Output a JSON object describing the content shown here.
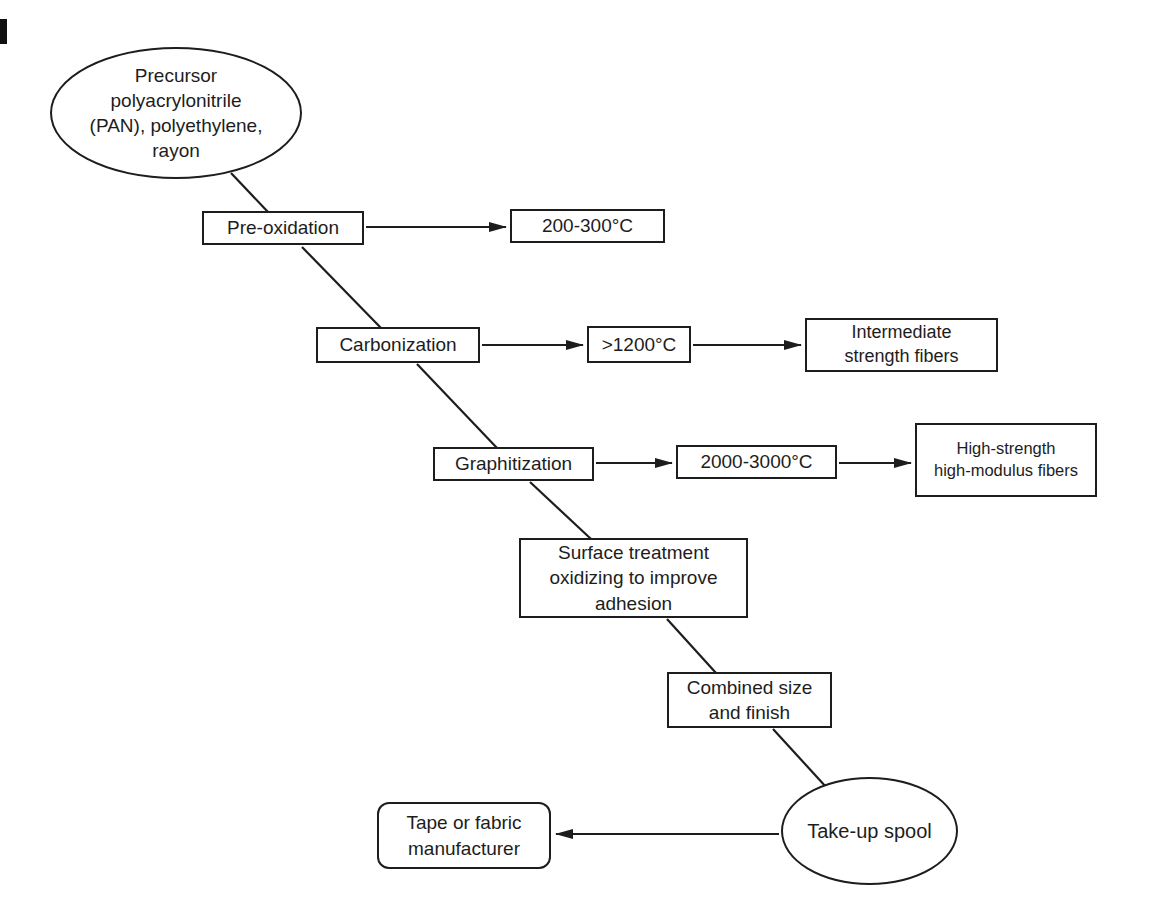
{
  "colors": {
    "ink": "#1d1d1d",
    "paper": "#ffffff"
  },
  "nodes": {
    "precursor": {
      "shape": "ellipse",
      "label": "Precursor\npolyacrylonitrile\n(PAN), polyethylene,\nrayon"
    },
    "pre_oxidation": {
      "shape": "rect",
      "label": "Pre-oxidation"
    },
    "temp_pre_oxidation": {
      "shape": "rect",
      "label": "200-300°C"
    },
    "carbonization": {
      "shape": "rect",
      "label": "Carbonization"
    },
    "temp_carbonization": {
      "shape": "rect",
      "label": ">1200°C"
    },
    "intermediate_fibers": {
      "shape": "rect",
      "label": "Intermediate\nstrength fibers"
    },
    "graphitization": {
      "shape": "rect",
      "label": "Graphitization"
    },
    "temp_graphitization": {
      "shape": "rect",
      "label": "2000-3000°C"
    },
    "high_modulus_fibers": {
      "shape": "rect",
      "label": "High-strength\nhigh-modulus fibers"
    },
    "surface_treatment": {
      "shape": "rect",
      "label": "Surface treatment\noxidizing to improve\nadhesion"
    },
    "combined_size_finish": {
      "shape": "rect",
      "label": "Combined size\nand finish"
    },
    "take_up_spool": {
      "shape": "ellipse",
      "label": "Take-up spool"
    },
    "tape_fabric_manufacturer": {
      "shape": "rounded-rect",
      "label": "Tape or fabric\nmanufacturer"
    }
  }
}
